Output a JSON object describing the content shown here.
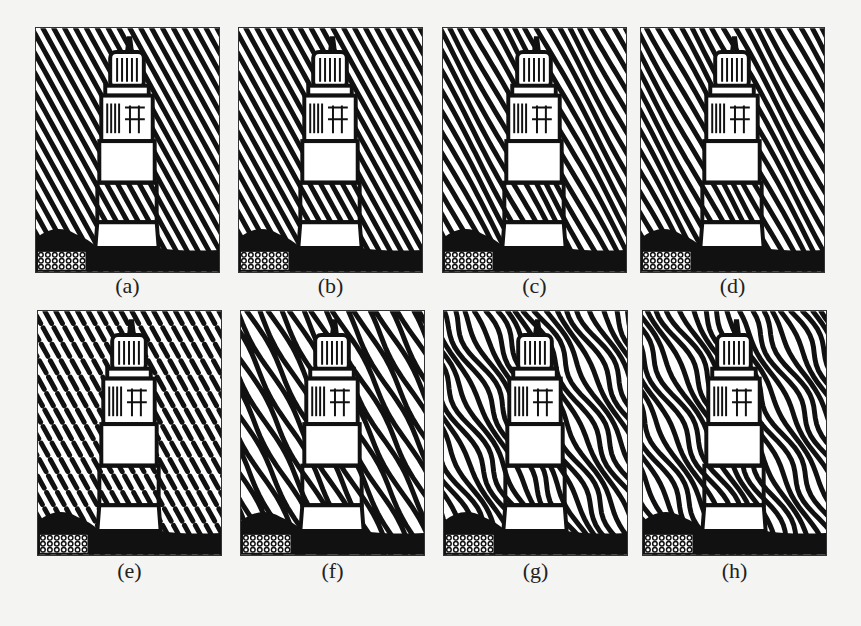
{
  "figure": {
    "subject": "lighthouse rendered with stripe (reaction-diffusion) halftone patterns",
    "panels": [
      {
        "id": "a",
        "label": "(a)",
        "style": "straight"
      },
      {
        "id": "b",
        "label": "(b)",
        "style": "straight"
      },
      {
        "id": "c",
        "label": "(c)",
        "style": "slightly-wavy"
      },
      {
        "id": "d",
        "label": "(d)",
        "style": "slightly-wavy"
      },
      {
        "id": "e",
        "label": "(e)",
        "style": "dotted-broken"
      },
      {
        "id": "f",
        "label": "(f)",
        "style": "wavy"
      },
      {
        "id": "g",
        "label": "(g)",
        "style": "labyrinth"
      },
      {
        "id": "h",
        "label": "(h)",
        "style": "labyrinth"
      }
    ]
  },
  "colors": {
    "ink": "#111111",
    "paper": "#ffffff",
    "background": "#f4f4f2"
  }
}
